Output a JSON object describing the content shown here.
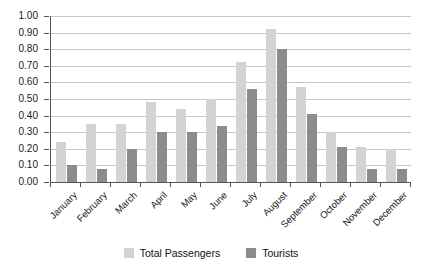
{
  "chart_data": {
    "type": "bar",
    "title": "",
    "xlabel": "",
    "ylabel": "",
    "ylim": [
      0,
      1.0
    ],
    "ytick_step": 0.1,
    "grid": true,
    "legend_position": "bottom",
    "categories": [
      "January",
      "February",
      "March",
      "April",
      "May",
      "June",
      "July",
      "August",
      "September",
      "October",
      "November",
      "December"
    ],
    "ytick_labels": [
      "1.00",
      "0.90",
      "0.80",
      "0.70",
      "0.60",
      "0.50",
      "0.40",
      "0.30",
      "0.20",
      "0.10",
      "0.00"
    ],
    "ytick_values": [
      1.0,
      0.9,
      0.8,
      0.7,
      0.6,
      0.5,
      0.4,
      0.3,
      0.2,
      0.1,
      0.0
    ],
    "series": [
      {
        "name": "Total Passengers",
        "color": "#d3d3d3",
        "values": [
          0.24,
          0.35,
          0.35,
          0.48,
          0.44,
          0.5,
          0.72,
          0.92,
          0.57,
          0.3,
          0.21,
          0.2
        ]
      },
      {
        "name": "Tourists",
        "color": "#8c8c8c",
        "values": [
          0.1,
          0.08,
          0.2,
          0.3,
          0.3,
          0.34,
          0.56,
          0.8,
          0.41,
          0.21,
          0.08,
          0.08
        ]
      }
    ]
  },
  "legend": {
    "items": [
      {
        "label": "Total Passengers",
        "color": "#d3d3d3"
      },
      {
        "label": "Tourists",
        "color": "#8c8c8c"
      }
    ]
  }
}
